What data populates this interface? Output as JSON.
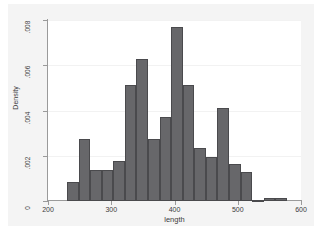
{
  "chart_data": {
    "type": "bar",
    "title": "",
    "subtitle": "",
    "xlabel": "length",
    "ylabel": "Density",
    "xlim": [
      200,
      600
    ],
    "ylim": [
      0,
      0.008
    ],
    "grid": true,
    "legend": null,
    "xticks": [
      "200",
      "300",
      "400",
      "500",
      "600"
    ],
    "xtick_values": [
      200,
      300,
      400,
      500,
      600
    ],
    "yticks": [
      "0",
      ".002",
      ".004",
      ".006",
      ".008"
    ],
    "ytick_values": [
      0,
      0.002,
      0.004,
      0.006,
      0.008
    ],
    "bin_width": 18.3,
    "bin_edges": [
      230.0,
      248.3,
      266.6,
      284.9,
      303.2,
      321.5,
      339.8,
      358.1,
      376.4,
      394.7,
      413.0,
      431.3,
      449.6,
      467.9,
      486.2,
      504.5,
      522.8,
      541.1,
      559.4,
      577.7
    ],
    "categories": [
      "230-248",
      "248-267",
      "267-285",
      "285-303",
      "303-322",
      "322-340",
      "340-358",
      "358-376",
      "376-395",
      "395-413",
      "413-431",
      "431-450",
      "450-468",
      "468-486",
      "486-504",
      "504-523",
      "523-541",
      "541-559",
      "559-578"
    ],
    "values": [
      0.00083,
      0.00275,
      0.00137,
      0.00137,
      0.00178,
      0.00512,
      0.00629,
      0.00275,
      0.00371,
      0.0077,
      0.00512,
      0.00234,
      0.00193,
      0.00413,
      0.00165,
      0.0013,
      0.0,
      0.00012,
      0.00012
    ],
    "bar_color": "#67676a",
    "bar_edge_color": "#4a4a4d",
    "plot_bg": "#ffffff",
    "figure_bg": "#f4f4f4",
    "gridline_color": "#f2f2f2",
    "axis_color": "#9a9a9a"
  }
}
